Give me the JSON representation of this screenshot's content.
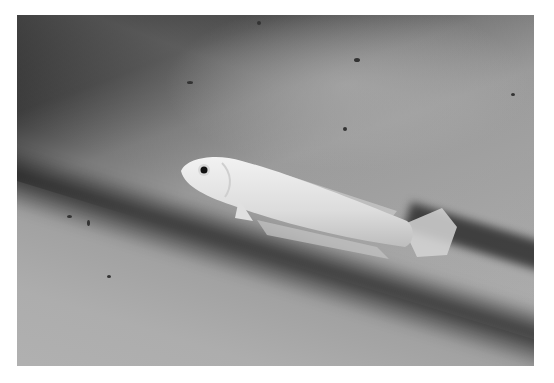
{
  "image": {
    "description": "Grayscale photograph of a pale, translucent fish resting diagonally on a textured sandy surface with a dark shadow band behind it",
    "subject": "pale-fish",
    "colors": {
      "border": "#ffffff",
      "shadow": "#1c1c1c",
      "sand": "#a8a8a8",
      "fish_body": "#e8e8e8",
      "eye": "#111111"
    }
  }
}
